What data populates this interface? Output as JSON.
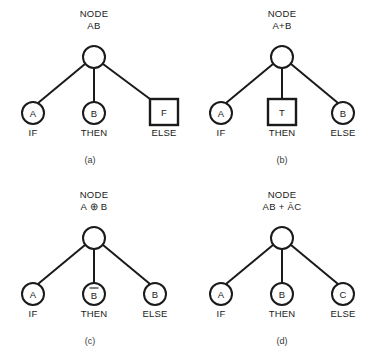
{
  "figure": {
    "background_color": "#ffffff",
    "line_color": "#1a1a1a",
    "panels": [
      {
        "caption": "(a)",
        "root": {
          "title_line1": "NODE",
          "title_line2": "AB",
          "shape": "circle",
          "label": ""
        },
        "leaves": [
          {
            "letter": "A",
            "shape": "circle",
            "role": "IF",
            "overbar": false
          },
          {
            "letter": "B",
            "shape": "circle",
            "role": "THEN",
            "overbar": false
          },
          {
            "letter": "F",
            "shape": "square",
            "role": "ELSE",
            "overbar": false
          }
        ]
      },
      {
        "caption": "(b)",
        "root": {
          "title_line1": "NODE",
          "title_line2": "A+B",
          "shape": "circle",
          "label": ""
        },
        "leaves": [
          {
            "letter": "A",
            "shape": "circle",
            "role": "IF",
            "overbar": false
          },
          {
            "letter": "T",
            "shape": "square",
            "role": "THEN",
            "overbar": false
          },
          {
            "letter": "B",
            "shape": "circle",
            "role": "ELSE",
            "overbar": false
          }
        ]
      },
      {
        "caption": "(c)",
        "root": {
          "title_line1": "NODE",
          "title_line2": "A ⊕ B",
          "shape": "circle",
          "label": ""
        },
        "leaves": [
          {
            "letter": "A",
            "shape": "circle",
            "role": "IF",
            "overbar": false
          },
          {
            "letter": "B",
            "shape": "circle",
            "role": "THEN",
            "overbar": true
          },
          {
            "letter": "B",
            "shape": "circle",
            "role": "ELSE",
            "overbar": false
          }
        ]
      },
      {
        "caption": "(d)",
        "root": {
          "title_line1": "NODE",
          "title_line2": "AB + ĀC",
          "shape": "circle",
          "label": ""
        },
        "leaves": [
          {
            "letter": "A",
            "shape": "circle",
            "role": "IF",
            "overbar": false
          },
          {
            "letter": "B",
            "shape": "circle",
            "role": "THEN",
            "overbar": false
          },
          {
            "letter": "C",
            "shape": "circle",
            "role": "ELSE",
            "overbar": false
          }
        ]
      }
    ]
  }
}
